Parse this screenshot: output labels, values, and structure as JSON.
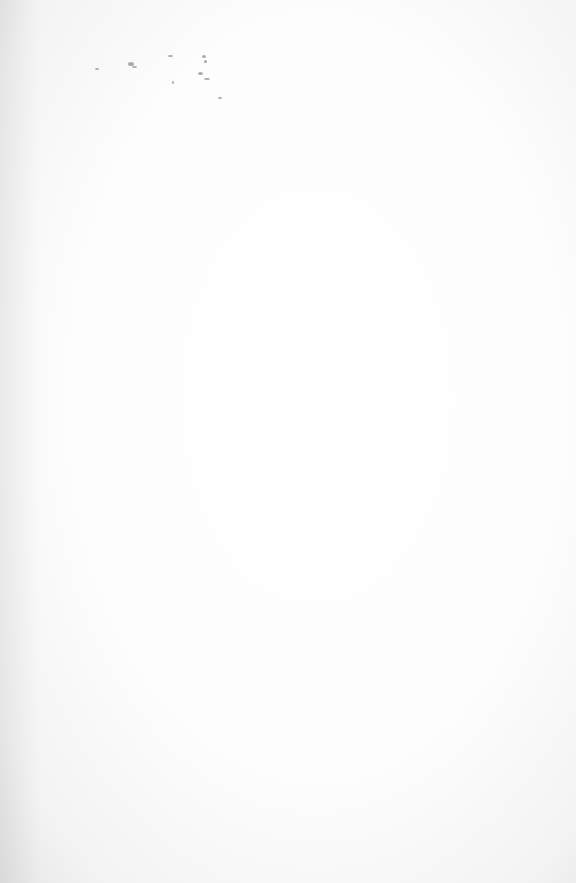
{
  "document": {
    "type": "scanned-page",
    "content_note": "",
    "illegible_marks": [
      {
        "x": 95,
        "y": 68,
        "w": 4,
        "h": 2
      },
      {
        "x": 128,
        "y": 62,
        "w": 6,
        "h": 4
      },
      {
        "x": 168,
        "y": 55,
        "w": 5,
        "h": 2
      },
      {
        "x": 202,
        "y": 55,
        "w": 4,
        "h": 3
      },
      {
        "x": 204,
        "y": 60,
        "w": 3,
        "h": 3
      },
      {
        "x": 198,
        "y": 72,
        "w": 5,
        "h": 3
      },
      {
        "x": 204,
        "y": 78,
        "w": 6,
        "h": 2
      },
      {
        "x": 172,
        "y": 81,
        "w": 2,
        "h": 3
      },
      {
        "x": 218,
        "y": 97,
        "w": 4,
        "h": 2
      },
      {
        "x": 132,
        "y": 66,
        "w": 5,
        "h": 2
      }
    ]
  }
}
